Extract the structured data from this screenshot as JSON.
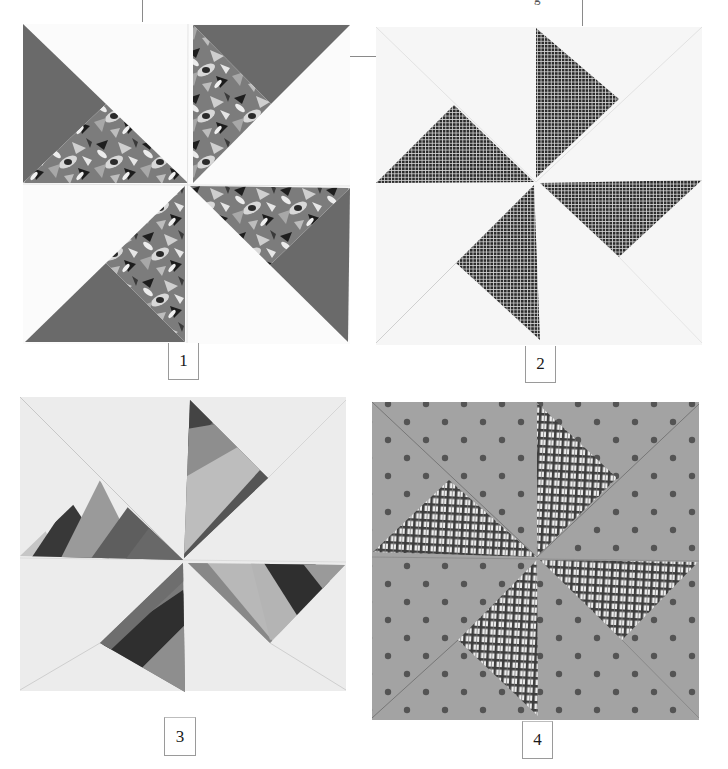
{
  "page": {
    "kind": "quilt block illustrations",
    "background": "#ffffff"
  },
  "blocks": [
    {
      "id": 1,
      "label": "1",
      "description": "Pinwheel block with floral and solid gray triangles on white",
      "colors": {
        "background": "#fbfbfb",
        "solid": "#6a6a6a",
        "print": "floral"
      }
    },
    {
      "id": 2,
      "label": "2",
      "description": "Pinwheel block with dark checked triangles on white",
      "colors": {
        "background": "#f6f6f6",
        "print": "#2e2e2e"
      }
    },
    {
      "id": 3,
      "label": "3",
      "description": "Pinwheel block with strip-pieced striped triangles on light background",
      "colors": {
        "background": "#eeeeee",
        "stripes": [
          "#3a3a3a",
          "#8c8c8c",
          "#b4b4b4",
          "#646464"
        ]
      }
    },
    {
      "id": 4,
      "label": "4",
      "description": "Pinwheel block with plaid triangles on gray polka-dot background",
      "colors": {
        "background": "#a3a3a3",
        "dots": "#555555",
        "plaid": "#3c3c3c"
      }
    }
  ]
}
